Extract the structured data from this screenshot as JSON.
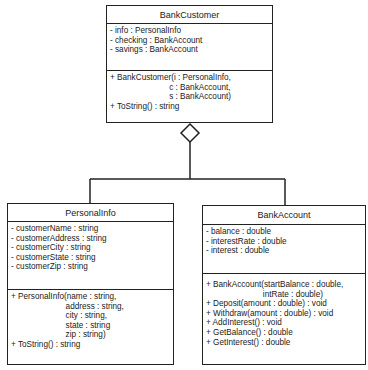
{
  "diagram": {
    "type": "UML class diagram",
    "relationship": "aggregation",
    "classes": {
      "bank_customer": {
        "name": "BankCustomer",
        "attributes": [
          "- info : PersonalInfo",
          "- checking : BankAccount",
          "- savings : BankAccount"
        ],
        "operations": [
          "+ BankCustomer(i : PersonalInfo,",
          "                          c : BankAccount,",
          "                          s : BankAccount)",
          "+ ToString() : string"
        ]
      },
      "personal_info": {
        "name": "PersonalInfo",
        "attributes": [
          "- customerName : string",
          "- customerAddress : string",
          "- customerCity : string",
          "- customerState : string",
          "- customerZip : string"
        ],
        "operations": [
          "+ PersonalInfo(name : string,",
          "                        address : string,",
          "                        city : string,",
          "                        state : string",
          "                        zip : string)",
          "+ ToString() : string"
        ]
      },
      "bank_account": {
        "name": "BankAccount",
        "attributes": [
          "- balance : double",
          "- interestRate : double",
          "- interest : double"
        ],
        "operations": [
          "+ BankAccount(startBalance : double,",
          "                         intRate : double)",
          "+ Deposit(amount : double) : void",
          "+ Withdraw(amount : double) : void",
          "+ AddInterest() : void",
          "+ GetBalance() : double",
          "+ GetInterest() : double"
        ]
      }
    }
  }
}
